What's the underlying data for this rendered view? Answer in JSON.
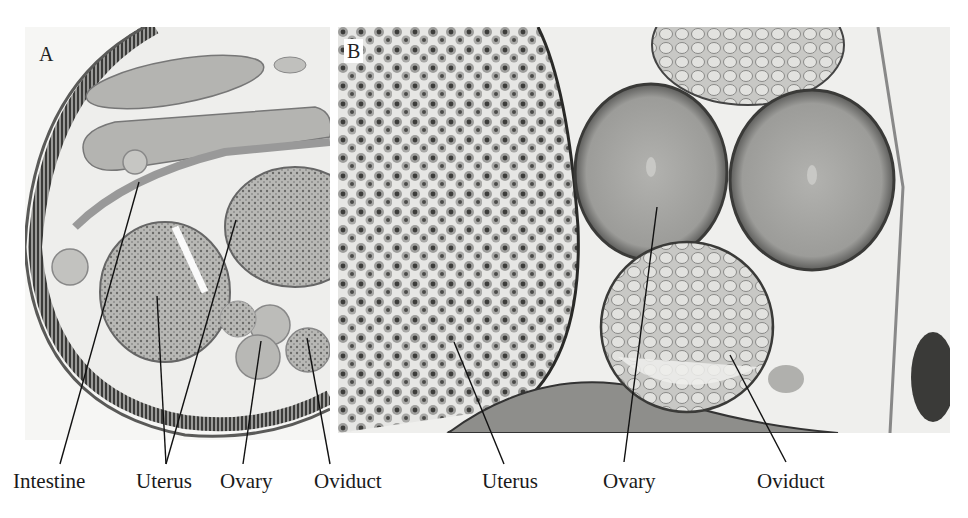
{
  "figure": {
    "panels": [
      {
        "id": "A",
        "letter": "A",
        "description": "Cross section of nematode body showing intestine, uterus, ovary and oviduct"
      },
      {
        "id": "B",
        "letter": "B",
        "description": "Higher magnification of uterus, ovary and oviduct"
      }
    ],
    "labels": [
      {
        "text": "Intestine",
        "panel": "A",
        "x": 13
      },
      {
        "text": "Uterus",
        "panel": "A",
        "x": 136
      },
      {
        "text": "Ovary",
        "panel": "A",
        "x": 220
      },
      {
        "text": "Oviduct",
        "panel": "A",
        "x": 314
      },
      {
        "text": "Uterus",
        "panel": "B",
        "x": 482
      },
      {
        "text": "Ovary",
        "panel": "B",
        "x": 603
      },
      {
        "text": "Oviduct",
        "panel": "B",
        "x": 757
      }
    ]
  }
}
